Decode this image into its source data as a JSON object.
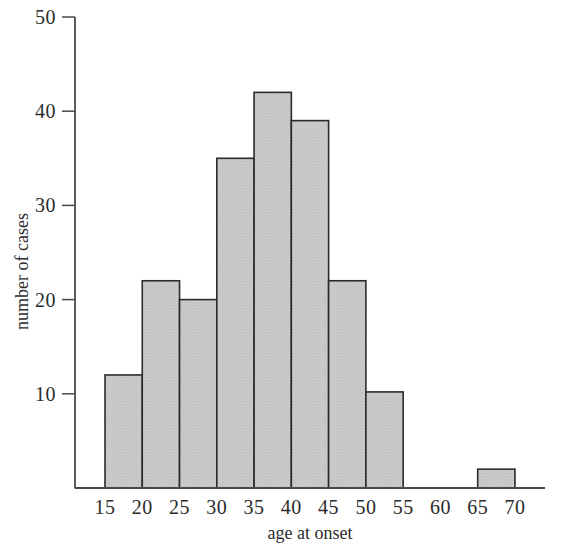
{
  "chart_data": {
    "type": "bar",
    "title": "",
    "subtitle": "",
    "xlabel": "age at onset",
    "ylabel": "number of cases",
    "grid": false,
    "legend": null,
    "xlim": [
      13,
      73
    ],
    "ylim": [
      0,
      50
    ],
    "bin_width": 5,
    "x_ticks": [
      15,
      20,
      25,
      30,
      35,
      40,
      45,
      50,
      55,
      60,
      65,
      70
    ],
    "x_tick_labels": [
      "15",
      "20",
      "25",
      "30",
      "35",
      "40",
      "45",
      "50",
      "55",
      "60",
      "65",
      "70"
    ],
    "y_ticks": [
      10,
      20,
      30,
      40,
      50
    ],
    "y_tick_labels": [
      "10",
      "20",
      "30",
      "40",
      "50"
    ],
    "bins": [
      {
        "start": 15,
        "end": 20,
        "value": 12
      },
      {
        "start": 20,
        "end": 25,
        "value": 22
      },
      {
        "start": 25,
        "end": 30,
        "value": 20
      },
      {
        "start": 30,
        "end": 35,
        "value": 35
      },
      {
        "start": 35,
        "end": 40,
        "value": 42
      },
      {
        "start": 40,
        "end": 45,
        "value": 39
      },
      {
        "start": 45,
        "end": 50,
        "value": 22
      },
      {
        "start": 50,
        "end": 55,
        "value": 10.2
      },
      {
        "start": 65,
        "end": 70,
        "value": 2
      }
    ],
    "categories": [
      "15-20",
      "20-25",
      "25-30",
      "30-35",
      "35-40",
      "40-45",
      "45-50",
      "50-55",
      "65-70"
    ],
    "values": [
      12,
      22,
      20,
      35,
      42,
      39,
      22,
      10.2,
      2
    ],
    "colors": {
      "bar_fill": "#c9c9c9",
      "bar_edge": "#2b2b2b",
      "axis": "#4a4a4a",
      "text": "#2b2b2b",
      "background": "#ffffff"
    }
  }
}
